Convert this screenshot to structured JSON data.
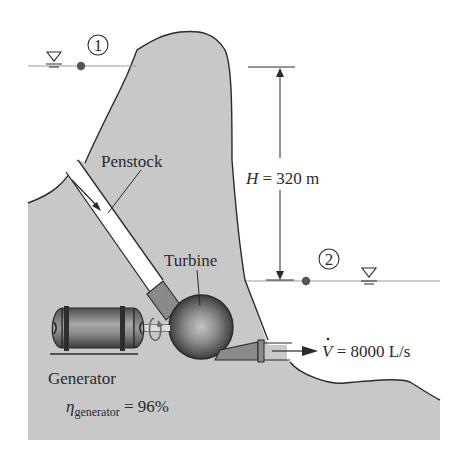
{
  "diagram": {
    "labels": {
      "point1": "1",
      "point2": "2",
      "penstock": "Penstock",
      "turbine": "Turbine",
      "generator": "Generator",
      "head_symbol": "H",
      "head_eq": " = 320 m",
      "flow_symbol": "V",
      "flow_eq": " = 8000 L/s",
      "eta_symbol": "η",
      "eta_sub": "generator",
      "eta_eq": " = 96%"
    },
    "values": {
      "head_m": 320,
      "flow_rate_L_per_s": 8000,
      "generator_efficiency_pct": 96
    },
    "colors": {
      "rock": "#c8c8c8",
      "outline": "#2a2a2a",
      "pipe_fill": "#ffffff",
      "pipe_transition": "#8a8a8a",
      "turbine_dark": "#3a3a3a",
      "turbine_light": "#b5b5b5",
      "water_line": "#9a9a9a",
      "point_marker": "#555555"
    }
  }
}
